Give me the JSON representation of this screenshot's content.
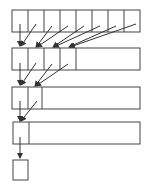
{
  "diagram": {
    "rows": [
      {
        "cells": 8
      },
      {
        "cells": 4
      },
      {
        "cells": 2
      },
      {
        "cells": 1
      }
    ],
    "final_box": 1,
    "colors": {
      "stroke": "#333333",
      "background": "#ffffff"
    }
  }
}
